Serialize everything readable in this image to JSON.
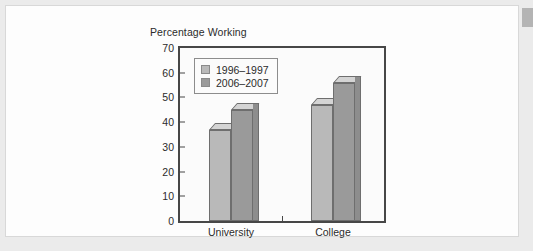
{
  "chart_data": {
    "type": "bar",
    "title": "",
    "ylabel": "Percentage Working",
    "xlabel": "",
    "categories": [
      "University",
      "College"
    ],
    "series": [
      {
        "name": "1996–1997",
        "values": [
          37,
          47
        ],
        "color": "#b9b9b9"
      },
      {
        "name": "2006–2007",
        "values": [
          45,
          56
        ],
        "color": "#9a9a9a"
      }
    ],
    "ylim": [
      0,
      70
    ],
    "yticks": [
      0,
      10,
      20,
      30,
      40,
      50,
      60,
      70
    ],
    "ytick_labels": [
      "0",
      "10",
      "20",
      "30",
      "40",
      "50",
      "60",
      "70"
    ],
    "grid": false,
    "legend_position": "top-left-inside",
    "style": "3d-bars",
    "bar_top_color": "#d4d4d4",
    "bar_side_color": "#8d8d8d",
    "axis_color": "#474747"
  },
  "page": {
    "background_color": "#ebebeb",
    "card_color": "#fdfdfd",
    "corner_tab_color": "#b4b4b4"
  }
}
